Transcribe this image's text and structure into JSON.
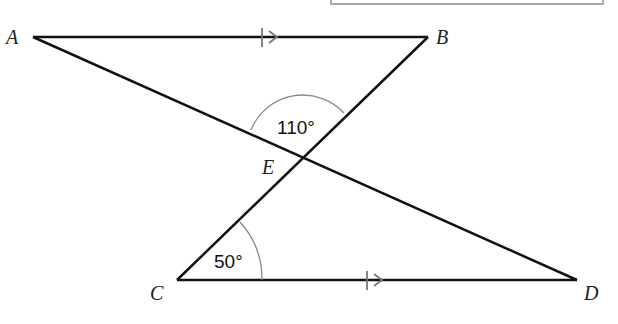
{
  "figure": {
    "type": "geometry",
    "points": {
      "A": {
        "label": "A",
        "x": 33,
        "y": 37
      },
      "B": {
        "label": "B",
        "x": 428,
        "y": 37
      },
      "C": {
        "label": "C",
        "x": 177,
        "y": 280
      },
      "D": {
        "label": "D",
        "x": 577,
        "y": 280
      },
      "E": {
        "label": "E",
        "x": 302,
        "y": 153
      }
    },
    "angles": {
      "AEB": {
        "label": "110°",
        "value": 110
      },
      "ECD": {
        "label": "50°",
        "value": 50
      }
    },
    "parallel_marks": [
      "AB",
      "CD"
    ]
  },
  "colors": {
    "line": "#111111",
    "arc": "#888888",
    "arrow": "#777777",
    "box_border": "#aaaaaa"
  }
}
